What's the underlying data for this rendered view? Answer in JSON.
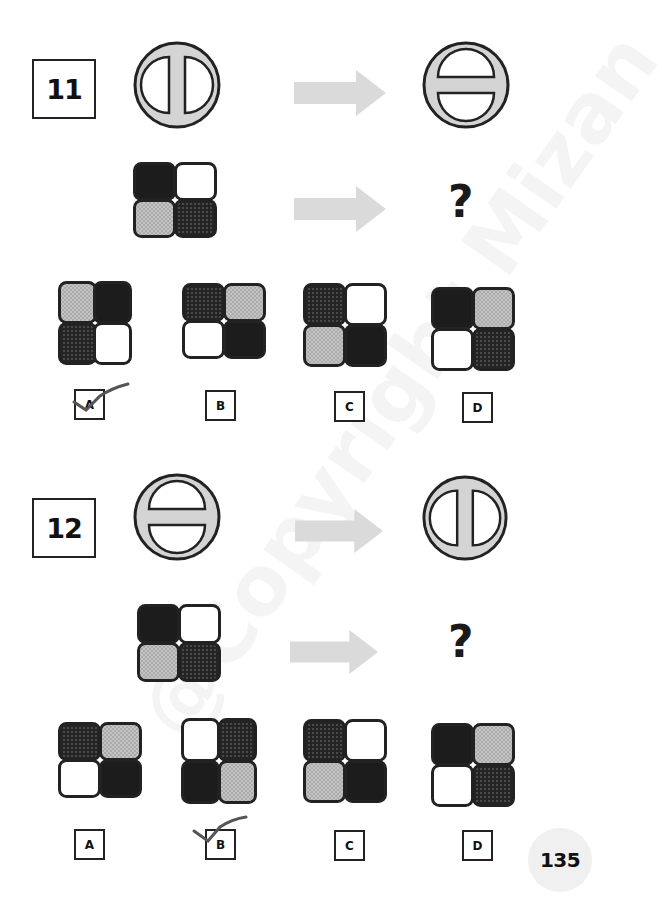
{
  "page": {
    "number": "135"
  },
  "watermark": "@Copyright Mizan",
  "colors": {
    "ring_fill": "#d4d4d4",
    "outline": "#222222",
    "arrow": "#dadada",
    "black": "#1c1c1c",
    "light_texture": "#bdbdbd",
    "dotted": "#2a2a2a",
    "white": "#ffffff"
  },
  "questions": [
    {
      "number": "11",
      "example": {
        "from": "circle-vertical-bar",
        "to": "circle-horizontal-bar"
      },
      "grid_question": [
        "black",
        "white",
        "light",
        "dotted"
      ],
      "question_mark": "?",
      "options": [
        {
          "label": "A",
          "cells": [
            "light",
            "black",
            "dotted",
            "white"
          ],
          "checked": true
        },
        {
          "label": "B",
          "cells": [
            "dotted",
            "light",
            "white",
            "black"
          ],
          "checked": false
        },
        {
          "label": "C",
          "cells": [
            "dotted",
            "white",
            "light",
            "black"
          ],
          "checked": false
        },
        {
          "label": "D",
          "cells": [
            "black",
            "light",
            "white",
            "dotted"
          ],
          "checked": false
        }
      ]
    },
    {
      "number": "12",
      "example": {
        "from": "circle-horizontal-bar",
        "to": "circle-vertical-bar"
      },
      "grid_question": [
        "black",
        "white",
        "light",
        "dotted"
      ],
      "question_mark": "?",
      "options": [
        {
          "label": "A",
          "cells": [
            "dotted",
            "light",
            "white",
            "black"
          ],
          "checked": false
        },
        {
          "label": "B",
          "cells": [
            "white",
            "dotted",
            "black",
            "light"
          ],
          "checked": true
        },
        {
          "label": "C",
          "cells": [
            "dotted",
            "white",
            "light",
            "black"
          ],
          "checked": false
        },
        {
          "label": "D",
          "cells": [
            "black",
            "light",
            "white",
            "dotted"
          ],
          "checked": false
        }
      ]
    }
  ]
}
